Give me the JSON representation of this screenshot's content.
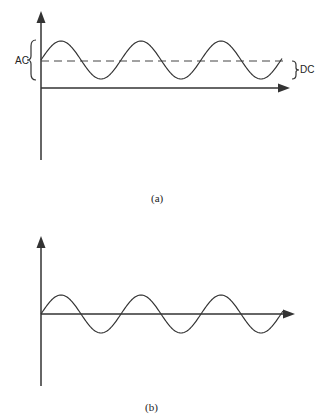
{
  "panels": [
    {
      "id": "a",
      "caption": "(a)",
      "labels": {
        "ac": "AC",
        "dc": "DC"
      },
      "description": "Sine wave with DC offset (dashed line marks DC level)"
    },
    {
      "id": "b",
      "caption": "(b)",
      "description": "Pure AC sine wave centered on the time axis"
    }
  ],
  "chart_data": [
    {
      "type": "line",
      "title": "(a)",
      "series": [
        {
          "name": "AC + DC signal",
          "function": "DC + A*sin(t)",
          "cycles": 3
        }
      ],
      "annotations": [
        "AC",
        "DC"
      ],
      "dc_level_dashed": true
    },
    {
      "type": "line",
      "title": "(b)",
      "series": [
        {
          "name": "AC signal",
          "function": "A*sin(t)",
          "cycles": 3
        }
      ]
    }
  ],
  "colors": {
    "line": "#333333",
    "background": "#ffffff"
  }
}
